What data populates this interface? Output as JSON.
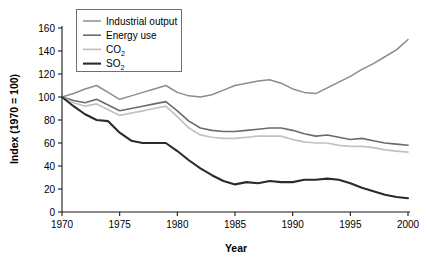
{
  "chart_data": {
    "type": "line",
    "title": "",
    "xlabel": "Year",
    "ylabel": "Index (1970 = 100)",
    "xlim": [
      1970,
      2000
    ],
    "ylim": [
      0,
      160
    ],
    "xticks": [
      1970,
      1975,
      1980,
      1985,
      1990,
      1995,
      2000
    ],
    "yticks": [
      0,
      20,
      40,
      60,
      80,
      100,
      120,
      140,
      160
    ],
    "grid": false,
    "legend_position": "top-left",
    "x": [
      1970,
      1971,
      1972,
      1973,
      1974,
      1975,
      1976,
      1977,
      1978,
      1979,
      1980,
      1981,
      1982,
      1983,
      1984,
      1985,
      1986,
      1987,
      1988,
      1989,
      1990,
      1991,
      1992,
      1993,
      1994,
      1995,
      1996,
      1997,
      1998,
      1999,
      2000
    ],
    "series": [
      {
        "name": "Industrial output",
        "color": "#8c8c8c",
        "width": 1.5,
        "values": [
          100,
          103,
          107,
          110,
          104,
          98,
          101,
          104,
          107,
          110,
          104,
          101,
          100,
          102,
          106,
          110,
          112,
          114,
          115,
          112,
          107,
          104,
          103,
          108,
          113,
          118,
          124,
          129,
          135,
          141,
          150
        ]
      },
      {
        "name": "Energy use",
        "color": "#6b6b6b",
        "width": 1.6,
        "values": [
          100,
          97,
          95,
          98,
          93,
          88,
          90,
          92,
          94,
          96,
          88,
          79,
          73,
          71,
          70,
          70,
          71,
          72,
          73,
          73,
          71,
          68,
          66,
          67,
          65,
          63,
          64,
          62,
          60,
          59,
          58
        ]
      },
      {
        "name": "CO2",
        "color": "#c2c2c2",
        "width": 1.7,
        "values": [
          100,
          95,
          92,
          94,
          89,
          84,
          86,
          88,
          90,
          92,
          83,
          73,
          67,
          65,
          64,
          64,
          65,
          66,
          66,
          66,
          63,
          61,
          60,
          60,
          58,
          57,
          57,
          56,
          54,
          53,
          52
        ]
      },
      {
        "name": "SO2",
        "color": "#2b2b2b",
        "width": 2.1,
        "values": [
          100,
          92,
          85,
          80,
          79,
          69,
          62,
          60,
          60,
          60,
          53,
          45,
          38,
          32,
          27,
          24,
          26,
          25,
          27,
          26,
          26,
          28,
          28,
          29,
          28,
          25,
          21,
          18,
          15,
          13,
          12
        ]
      }
    ],
    "legend_entries": [
      {
        "label": "Industrial output",
        "sub": "",
        "color": "#8c8c8c",
        "width": 1.5
      },
      {
        "label": "Energy use",
        "sub": "",
        "color": "#6b6b6b",
        "width": 1.6
      },
      {
        "label": "CO",
        "sub": "2",
        "color": "#c2c2c2",
        "width": 1.7
      },
      {
        "label": "SO",
        "sub": "2",
        "color": "#2b2b2b",
        "width": 2.1
      }
    ]
  }
}
